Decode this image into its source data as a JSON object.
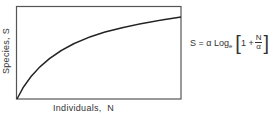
{
  "diagram": {
    "y_axis_label": "Species, S",
    "x_axis_label": "Individuals,  N",
    "formula": {
      "lhs": "S = α Log",
      "log_base": "e",
      "bracket_open": "[",
      "inner_term": "1 +",
      "fraction_numerator": "N",
      "fraction_denominator": "α",
      "bracket_close": "]"
    },
    "curve": "logarithmic species-accumulation curve rising from origin and flattening toward top-right",
    "colors": {
      "line": "#222222",
      "frame": "#555555",
      "background": "#ffffff"
    }
  }
}
